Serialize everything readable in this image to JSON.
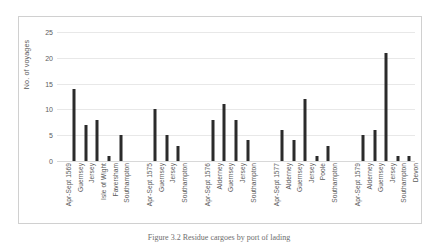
{
  "figure": {
    "caption": "Figure 3.2 Residue cargoes by port of lading"
  },
  "chart_data": {
    "type": "bar",
    "title": "",
    "xlabel": "",
    "ylabel": "No. of voyages",
    "ylim": [
      0,
      25
    ],
    "yticks": [
      0,
      5,
      10,
      15,
      20,
      25
    ],
    "grid": true,
    "legend": false,
    "bar_color": "#2b2b2b",
    "categories": [
      "Apr-Sept 1569",
      "Guernsey",
      "Jersey",
      "Isle of Wight",
      "Faversham",
      "Southampton",
      "",
      "Apr-Sept 1575",
      "Guernsey",
      "Jersey",
      "Southampton",
      "",
      "Apr-Sept 1576",
      "Alderney",
      "Guernsey",
      "Jersey",
      "Southampton",
      "",
      "Apr-Sept 1577",
      "Alderney",
      "Guernsey",
      "Jersey",
      "Poole",
      "Southampton",
      "",
      "Apr-Sept 1579",
      "Alderney",
      "Guernsey",
      "Jersey",
      "Southampton",
      "Devon"
    ],
    "values": [
      0,
      14,
      7,
      8,
      1,
      5,
      0,
      0,
      10,
      5,
      3,
      0,
      0,
      8,
      11,
      8,
      4,
      0,
      0,
      6,
      4,
      12,
      1,
      3,
      0,
      0,
      5,
      6,
      21,
      1,
      1
    ],
    "groups": [
      {
        "label": "Apr-Sept 1569",
        "points": [
          {
            "port": "Guernsey",
            "value": 14
          },
          {
            "port": "Jersey",
            "value": 7
          },
          {
            "port": "Isle of Wight",
            "value": 8
          },
          {
            "port": "Faversham",
            "value": 1
          },
          {
            "port": "Southampton",
            "value": 5
          }
        ]
      },
      {
        "label": "Apr-Sept 1575",
        "points": [
          {
            "port": "Guernsey",
            "value": 10
          },
          {
            "port": "Jersey",
            "value": 5
          },
          {
            "port": "Southampton",
            "value": 3
          }
        ]
      },
      {
        "label": "Apr-Sept 1576",
        "points": [
          {
            "port": "Alderney",
            "value": 8
          },
          {
            "port": "Guernsey",
            "value": 11
          },
          {
            "port": "Jersey",
            "value": 8
          },
          {
            "port": "Southampton",
            "value": 4
          }
        ]
      },
      {
        "label": "Apr-Sept 1577",
        "points": [
          {
            "port": "Alderney",
            "value": 6
          },
          {
            "port": "Guernsey",
            "value": 4
          },
          {
            "port": "Jersey",
            "value": 12
          },
          {
            "port": "Poole",
            "value": 1
          },
          {
            "port": "Southampton",
            "value": 3
          }
        ]
      },
      {
        "label": "Apr-Sept 1579",
        "points": [
          {
            "port": "Alderney",
            "value": 5
          },
          {
            "port": "Guernsey",
            "value": 6
          },
          {
            "port": "Jersey",
            "value": 21
          },
          {
            "port": "Southampton",
            "value": 1
          },
          {
            "port": "Devon",
            "value": 1
          }
        ]
      }
    ]
  }
}
